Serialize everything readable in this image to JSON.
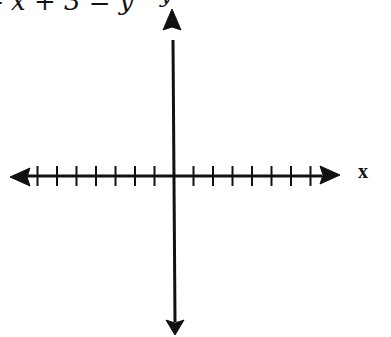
{
  "equation": "- x + 3 = y",
  "axes": {
    "x_label": "x",
    "y_label": "y",
    "ticks_left": 7,
    "ticks_right": 7
  },
  "colors": {
    "ink": "#111111",
    "background": "#ffffff"
  }
}
